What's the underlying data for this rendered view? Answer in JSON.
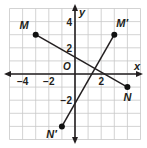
{
  "diagram": {
    "type": "coordinate-plane",
    "x_range": [
      -5,
      5
    ],
    "y_range": [
      -5,
      5
    ],
    "axis_labels": {
      "x": "x",
      "y": "y",
      "origin": "O"
    },
    "x_tick_labels": [
      {
        "value": -4,
        "text": "−4"
      },
      {
        "value": -2,
        "text": "−2"
      },
      {
        "value": 2,
        "text": "2"
      }
    ],
    "y_tick_labels": [
      {
        "value": 4,
        "text": "4"
      },
      {
        "value": 2,
        "text": "2"
      },
      {
        "value": -2,
        "text": "−2"
      }
    ],
    "points": [
      {
        "name": "M",
        "label": "M",
        "x": -3,
        "y": 3
      },
      {
        "name": "N",
        "label": "N",
        "x": 4,
        "y": -1
      },
      {
        "name": "M-prime",
        "label": "M′",
        "x": 3,
        "y": 3
      },
      {
        "name": "N-prime",
        "label": "N′",
        "x": -1,
        "y": -4
      }
    ],
    "segments": [
      {
        "name": "segment-MN",
        "from": "M",
        "to": "N"
      },
      {
        "name": "segment-MprimeNprime",
        "from": "M′",
        "to": "N′"
      }
    ],
    "colors": {
      "grid": "#c8c8c8",
      "axis": "#231f20",
      "segment": "#231f20",
      "point": "#111111"
    }
  }
}
